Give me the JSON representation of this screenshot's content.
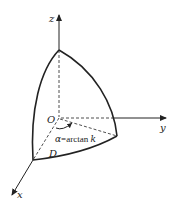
{
  "diagram": {
    "axes": {
      "x_label": "x",
      "y_label": "y",
      "z_label": "z",
      "origin_label": "O"
    },
    "annotations": {
      "angle_symbol": "α",
      "angle_rest": "=arctan ",
      "angle_k": "k",
      "region_label": "D"
    },
    "colors": {
      "stroke": "#222222",
      "background": "#ffffff"
    }
  }
}
